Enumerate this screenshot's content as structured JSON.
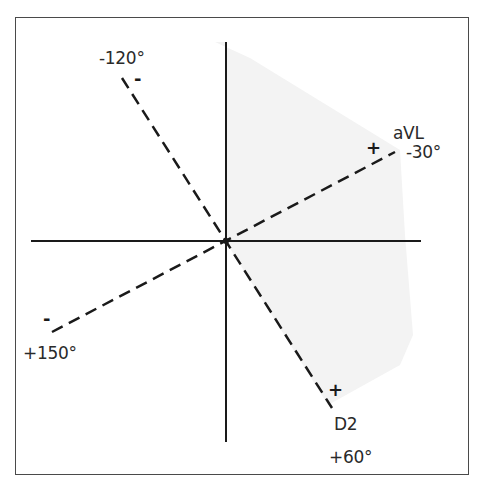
{
  "diagram": {
    "type": "hexaxial-reference-system",
    "shaded_sector": {
      "from_deg": -30,
      "to_deg": 60,
      "color": "#f2f2f2"
    },
    "axes": {
      "horizontal": true,
      "vertical": true,
      "color": "#1a1a1a"
    },
    "leads": [
      {
        "name": "aVL",
        "angle_label": "-30°",
        "positive_sign": "+",
        "style": "dashed"
      },
      {
        "name": "D2",
        "angle_label": "+60°",
        "positive_sign": "+",
        "style": "dashed"
      }
    ],
    "negative_ends": [
      {
        "angle_label": "-120°",
        "sign": "-"
      },
      {
        "angle_label": "+150°",
        "sign": "-"
      }
    ]
  },
  "labels": {
    "minus120": "-120°",
    "avl_name": "aVL",
    "minus30": "-30°",
    "plus150": "+150°",
    "d2_name": "D2",
    "plus60": "+60°",
    "plus_sign": "+",
    "minus_sign": "-"
  }
}
